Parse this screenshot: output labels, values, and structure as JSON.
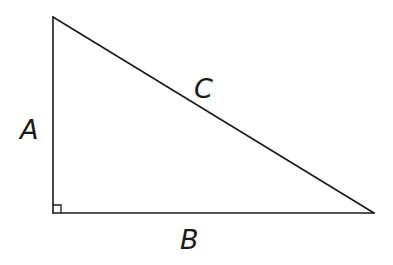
{
  "diagram": {
    "type": "right-triangle",
    "vertices": {
      "top": [
        53,
        17
      ],
      "right_angle": [
        53,
        213
      ],
      "right": [
        374,
        213
      ]
    },
    "sides": [
      {
        "id": "A",
        "label": "A",
        "description": "vertical leg"
      },
      {
        "id": "B",
        "label": "B",
        "description": "horizontal leg"
      },
      {
        "id": "C",
        "label": "C",
        "description": "hypotenuse"
      }
    ],
    "right_angle_marker": true,
    "colors": {
      "stroke": "#1a1a1a",
      "background": "#ffffff"
    }
  }
}
